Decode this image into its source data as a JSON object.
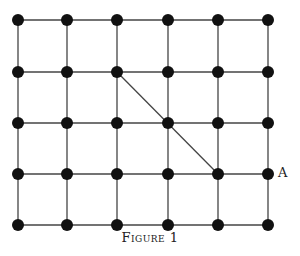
{
  "figure": {
    "caption": "Figure 1",
    "point_label": "A",
    "grid": {
      "columns": 6,
      "rows": 5,
      "x": [
        18,
        67,
        117,
        168,
        218,
        268
      ],
      "y": [
        20,
        72,
        123,
        174,
        225
      ]
    },
    "diagonal": {
      "from": [
        2,
        1
      ],
      "to": [
        4,
        3
      ]
    },
    "label_position": {
      "col": 5,
      "row": 3
    },
    "colors": {
      "line": "#444444",
      "dot": "#111111"
    }
  }
}
